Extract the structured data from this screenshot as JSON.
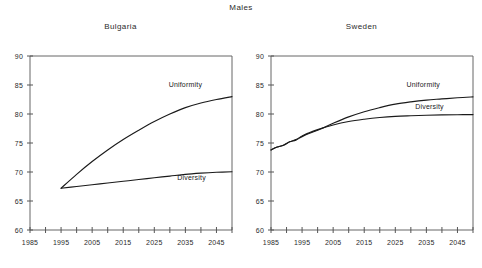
{
  "figure": {
    "main_title": "Males"
  },
  "chart_data": [
    {
      "type": "line",
      "title": "Bulgaria",
      "xlabel": "",
      "ylabel": "",
      "xlim": [
        1985,
        2050
      ],
      "ylim": [
        60,
        90
      ],
      "xticks": [
        1985,
        1990,
        1995,
        2000,
        2005,
        2010,
        2015,
        2020,
        2025,
        2030,
        2035,
        2040,
        2045,
        2050
      ],
      "xtick_labels": [
        "1985",
        "",
        "1995",
        "",
        "2005",
        "",
        "2015",
        "",
        "2025",
        "",
        "2035",
        "",
        "2045",
        ""
      ],
      "yticks": [
        60,
        65,
        70,
        75,
        80,
        85,
        90
      ],
      "ytick_labels": [
        "60",
        "65",
        "70",
        "75",
        "80",
        "85",
        "90"
      ],
      "grid": false,
      "legend": "inline-annotation",
      "series": [
        {
          "name": "Uniformity",
          "label_x": 2035,
          "label_y": 84.6,
          "x": [
            1995,
            2000,
            2005,
            2010,
            2015,
            2020,
            2025,
            2030,
            2035,
            2040,
            2045,
            2050
          ],
          "values": [
            67.2,
            69.6,
            71.8,
            73.8,
            75.6,
            77.2,
            78.7,
            80.0,
            81.1,
            81.9,
            82.5,
            83.0
          ]
        },
        {
          "name": "Diversity",
          "label_x": 2037,
          "label_y": 68.6,
          "x": [
            1995,
            2000,
            2005,
            2010,
            2015,
            2020,
            2025,
            2030,
            2035,
            2040,
            2045,
            2050
          ],
          "values": [
            67.2,
            67.5,
            67.8,
            68.1,
            68.4,
            68.7,
            69.0,
            69.3,
            69.6,
            69.8,
            69.95,
            70.05
          ]
        }
      ]
    },
    {
      "type": "line",
      "title": "Sweden",
      "xlabel": "",
      "ylabel": "",
      "xlim": [
        1985,
        2050
      ],
      "ylim": [
        60,
        90
      ],
      "xticks": [
        1985,
        1990,
        1995,
        2000,
        2005,
        2010,
        2015,
        2020,
        2025,
        2030,
        2035,
        2040,
        2045,
        2050
      ],
      "xtick_labels": [
        "1985",
        "",
        "1995",
        "",
        "2005",
        "",
        "2015",
        "",
        "2025",
        "",
        "2035",
        "",
        "2045",
        ""
      ],
      "yticks": [
        60,
        65,
        70,
        75,
        80,
        85,
        90
      ],
      "ytick_labels": [
        "60",
        "65",
        "70",
        "75",
        "80",
        "85",
        "90"
      ],
      "grid": false,
      "legend": "inline-annotation",
      "series": [
        {
          "name": "Uniformity",
          "label_x": 2034,
          "label_y": 84.6,
          "x": [
            1985,
            1987,
            1989,
            1991,
            1993,
            1995,
            1997,
            2000,
            2005,
            2010,
            2015,
            2020,
            2025,
            2030,
            2035,
            2040,
            2045,
            2050
          ],
          "values": [
            73.8,
            74.3,
            74.6,
            75.2,
            75.5,
            76.1,
            76.6,
            77.2,
            78.4,
            79.5,
            80.4,
            81.1,
            81.7,
            82.1,
            82.4,
            82.6,
            82.8,
            82.95
          ]
        },
        {
          "name": "Diversity",
          "label_x": 2036,
          "label_y": 80.9,
          "x": [
            1985,
            1987,
            1989,
            1991,
            1993,
            1995,
            1997,
            2000,
            2005,
            2010,
            2015,
            2020,
            2025,
            2030,
            2035,
            2040,
            2045,
            2050
          ],
          "values": [
            73.8,
            74.3,
            74.6,
            75.2,
            75.6,
            76.2,
            76.7,
            77.3,
            78.1,
            78.7,
            79.1,
            79.4,
            79.6,
            79.7,
            79.78,
            79.84,
            79.88,
            79.9
          ]
        }
      ]
    }
  ]
}
